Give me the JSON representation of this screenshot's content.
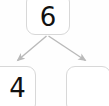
{
  "diagram": {
    "type": "number-bond",
    "canvas": {
      "width": 109,
      "height": 106
    },
    "colors": {
      "background": "#fefefe",
      "box_fill": "#ffffff",
      "box_border": "#d8d8d8",
      "digit": "#111111",
      "arrow": "#b9b9b9"
    },
    "nodes": [
      {
        "id": "whole",
        "role": "whole",
        "value": "6",
        "empty": false
      },
      {
        "id": "part-left",
        "role": "part",
        "value": "4",
        "empty": false
      },
      {
        "id": "part-right",
        "role": "part",
        "value": "",
        "empty": true
      }
    ],
    "edges": [
      {
        "id": "edge-left",
        "from": "whole",
        "to": "part-left",
        "arrow": true
      },
      {
        "id": "edge-right",
        "from": "whole",
        "to": "part-right",
        "arrow": true
      }
    ]
  }
}
